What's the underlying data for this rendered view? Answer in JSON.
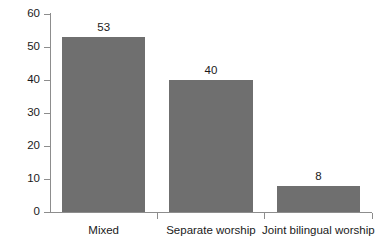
{
  "chart_data": {
    "type": "bar",
    "title": "",
    "subtitle": "",
    "xlabel": "",
    "ylabel": "Percent",
    "categories": [
      "Mixed",
      "Separate worship",
      "Joint bilingual worship"
    ],
    "values": [
      53,
      40,
      8
    ],
    "value_labels": [
      "53",
      "40",
      "8"
    ],
    "ylim": [
      0,
      60
    ],
    "yticks": [
      0,
      10,
      20,
      30,
      40,
      50,
      60
    ],
    "ytick_labels": [
      "0",
      "10",
      "20",
      "30",
      "40",
      "50",
      "60"
    ],
    "grid": false,
    "legend": false,
    "legend_position": "none",
    "bar_color": "#6f6f6f",
    "axis_color": "#8d8d8d",
    "text_color": "#1a1a1a",
    "background_color": "#ffffff"
  },
  "axes": {
    "y_label": "Percent"
  }
}
